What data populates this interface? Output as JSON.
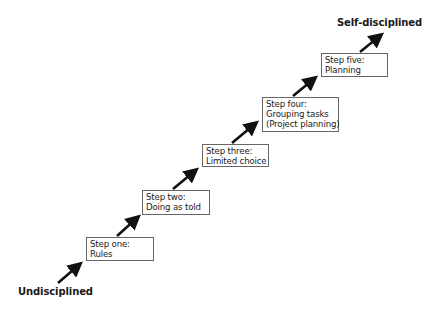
{
  "diagram": {
    "start_label": "Undisciplined",
    "end_label": "Self-disciplined",
    "steps": [
      {
        "title": "Step one:",
        "lines": [
          "Rules"
        ]
      },
      {
        "title": "Step two:",
        "lines": [
          "Doing as told"
        ]
      },
      {
        "title": "Step three:",
        "lines": [
          "Limited choice"
        ]
      },
      {
        "title": "Step four:",
        "lines": [
          "Grouping tasks",
          "(Project planning)"
        ]
      },
      {
        "title": "Step five:",
        "lines": [
          "Planning"
        ]
      }
    ],
    "colors": {
      "arrow": "#111111",
      "box_border": "#666666",
      "text": "#1a1a1a"
    }
  }
}
